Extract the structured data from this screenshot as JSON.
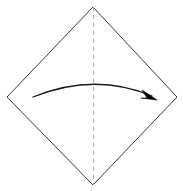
{
  "figure": {
    "type": "origami-fold-step-diagram",
    "title": "",
    "canvas": {
      "width": 183,
      "height": 191,
      "background": "#ffffff"
    },
    "paper": {
      "name": "square-sheet-rotated-45",
      "shape": "diamond",
      "stroke_color": "#3a3a3a",
      "stroke_width": 1,
      "fill": "#ffffff",
      "points": "93,7 177,97 93,185 7,97",
      "vertices": [
        {
          "name": "top",
          "x": 93,
          "y": 7
        },
        {
          "name": "right",
          "x": 177,
          "y": 97
        },
        {
          "name": "bottom",
          "x": 93,
          "y": 185
        },
        {
          "name": "left",
          "x": 7,
          "y": 97
        }
      ]
    },
    "fold_line": {
      "name": "vertical-valley-fold-line",
      "style": "dashed",
      "stroke_color": "#b0b0b0",
      "stroke_width": 1,
      "dash_pattern": "4,4",
      "x1": 93,
      "y1": 7,
      "x2": 93,
      "y2": 185
    },
    "fold_arrow": {
      "name": "left-to-right-fold-arrow",
      "direction": "left-to-right",
      "stroke_color": "#1a1a1a",
      "stroke_width": 1.3,
      "path": "M 33,97 Q 95,72 152,96",
      "start": {
        "x": 33,
        "y": 97
      },
      "control": {
        "x": 95,
        "y": 72
      },
      "end": {
        "x": 152,
        "y": 96
      },
      "arrowhead": {
        "name": "arrow-head",
        "fill": "#000000",
        "points": "157,100 142,90 147,98 141,98"
      }
    }
  }
}
